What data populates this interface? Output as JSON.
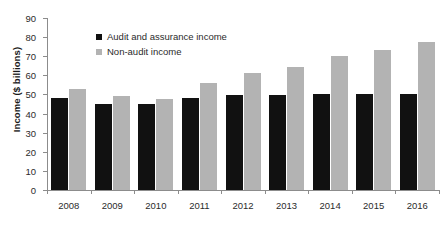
{
  "chart_data": {
    "type": "bar",
    "title": "",
    "xlabel": "",
    "ylabel": "Income ($ billions)",
    "categories": [
      "2008",
      "2009",
      "2010",
      "2011",
      "2012",
      "2013",
      "2014",
      "2015",
      "2016"
    ],
    "series": [
      {
        "name": "Audit and assurance income",
        "color": "#111111",
        "values": [
          48,
          45,
          45,
          48,
          49.5,
          49.5,
          50.5,
          50,
          50.5
        ]
      },
      {
        "name": "Non-audit income",
        "color": "#b3b3b3",
        "values": [
          53,
          49,
          47.5,
          56,
          61,
          64.5,
          70,
          73.5,
          77.5
        ]
      }
    ],
    "ylim": [
      0,
      90
    ],
    "ytick_step": 10,
    "yticks": [
      0,
      10,
      20,
      30,
      40,
      50,
      60,
      70,
      80,
      90
    ],
    "grid": false,
    "legend_position": "top-left-inside"
  }
}
